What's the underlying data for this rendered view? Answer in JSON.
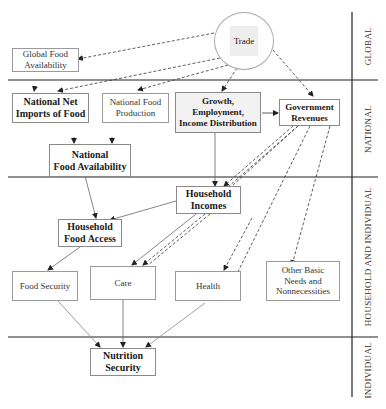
{
  "figure": {
    "type": "flow diagram",
    "caption_fragment": "(top caption line cut off)"
  },
  "levels": [
    {
      "id": "global",
      "label": "GLOBAL"
    },
    {
      "id": "national",
      "label": "NATIONAL"
    },
    {
      "id": "household",
      "label": "HOUSEHOLD AND INDIVIDUAL"
    },
    {
      "id": "individual",
      "label": "INDIVIDUAL"
    }
  ],
  "nodes": {
    "trade": {
      "label": "Trade",
      "level": "global",
      "shape": "circle"
    },
    "global_food_availability": {
      "label": "Global Food Availability",
      "level": "global"
    },
    "national_net_imports": {
      "label": "National Net Imports of Food",
      "level": "national"
    },
    "national_food_production": {
      "label": "National Food Production",
      "level": "national"
    },
    "growth": {
      "label": "Growth, Employment, Income Distribution",
      "level": "national"
    },
    "government_revenues": {
      "label": "Government Revenues",
      "level": "national"
    },
    "national_food_availability": {
      "label": "National Food Availability",
      "level": "national"
    },
    "household_incomes": {
      "label": "Household Incomes",
      "level": "household"
    },
    "household_food_access": {
      "label": "Household Food Access",
      "level": "household"
    },
    "food_security": {
      "label": "Food Security",
      "level": "household"
    },
    "care": {
      "label": "Care",
      "level": "household"
    },
    "health": {
      "label": "Health",
      "level": "household"
    },
    "other_basic_needs": {
      "label": "Other Basic Needs and Nonnecessities",
      "level": "household"
    },
    "nutrition_security": {
      "label": "Nutrition Security",
      "level": "individual"
    }
  },
  "labels": {
    "trade": "Trade",
    "global_food_availability_1": "Global Food",
    "global_food_availability_2": "Availability",
    "national_net_imports_1": "National Net",
    "national_net_imports_2": "Imports of Food",
    "national_food_production_1": "National Food",
    "national_food_production_2": "Production",
    "growth_1": "Growth,",
    "growth_2": "Employment,",
    "growth_3": "Income Distribution",
    "government_revenues_1": "Government",
    "government_revenues_2": "Revenues",
    "national_food_availability_1": "National",
    "national_food_availability_2": "Food Availability",
    "household_incomes_1": "Household",
    "household_incomes_2": "Incomes",
    "household_food_access_1": "Household",
    "household_food_access_2": "Food Access",
    "food_security": "Food Security",
    "care": "Care",
    "health": "Health",
    "other_basic_needs_1": "Other Basic",
    "other_basic_needs_2": "Needs and",
    "other_basic_needs_3": "Nonnecessities",
    "nutrition_security_1": "Nutrition",
    "nutrition_security_2": "Security"
  },
  "edges": [
    {
      "from": "trade",
      "to": "global_food_availability",
      "style": "dashed"
    },
    {
      "from": "trade",
      "to": "national_net_imports",
      "style": "dashed"
    },
    {
      "from": "trade",
      "to": "national_food_production",
      "style": "dashed"
    },
    {
      "from": "trade",
      "to": "growth",
      "style": "dashed"
    },
    {
      "from": "trade",
      "to": "government_revenues",
      "style": "dashed"
    },
    {
      "from": "growth",
      "to": "government_revenues",
      "style": "solid"
    },
    {
      "from": "growth",
      "to": "household_incomes",
      "style": "solid"
    },
    {
      "from": "national_net_imports",
      "to": "national_food_availability",
      "style": "solid"
    },
    {
      "from": "national_food_production",
      "to": "national_food_availability",
      "style": "solid"
    },
    {
      "from": "government_revenues",
      "to": "household_incomes",
      "style": "dashed"
    },
    {
      "from": "government_revenues",
      "to": "care",
      "style": "dashed"
    },
    {
      "from": "government_revenues",
      "to": "health",
      "style": "dashed"
    },
    {
      "from": "government_revenues",
      "to": "other_basic_needs",
      "style": "dashed"
    },
    {
      "from": "national_food_availability",
      "to": "household_food_access",
      "style": "solid"
    },
    {
      "from": "household_incomes",
      "to": "household_food_access",
      "style": "solid"
    },
    {
      "from": "household_incomes",
      "to": "care",
      "style": "solid"
    },
    {
      "from": "household_food_access",
      "to": "food_security",
      "style": "solid"
    },
    {
      "from": "food_security",
      "to": "nutrition_security",
      "style": "solid"
    },
    {
      "from": "care",
      "to": "nutrition_security",
      "style": "solid"
    },
    {
      "from": "health",
      "to": "nutrition_security",
      "style": "solid"
    }
  ]
}
